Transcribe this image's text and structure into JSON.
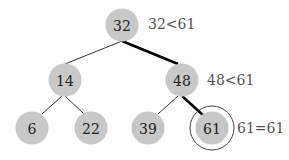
{
  "diagram": {
    "nodes": [
      {
        "id": "n32",
        "label": "32",
        "x": 122,
        "y": 25
      },
      {
        "id": "n14",
        "label": "14",
        "x": 65,
        "y": 80
      },
      {
        "id": "n48",
        "label": "48",
        "x": 182,
        "y": 80
      },
      {
        "id": "n6",
        "label": "6",
        "x": 32,
        "y": 128
      },
      {
        "id": "n22",
        "label": "22",
        "x": 91,
        "y": 128
      },
      {
        "id": "n39",
        "label": "39",
        "x": 148,
        "y": 128
      },
      {
        "id": "n61",
        "label": "61",
        "x": 212,
        "y": 128
      }
    ],
    "edges": [
      {
        "from": "n32",
        "to": "n14",
        "highlighted": false
      },
      {
        "from": "n32",
        "to": "n48",
        "highlighted": true
      },
      {
        "from": "n14",
        "to": "n6",
        "highlighted": false
      },
      {
        "from": "n14",
        "to": "n22",
        "highlighted": false
      },
      {
        "from": "n48",
        "to": "n39",
        "highlighted": false
      },
      {
        "from": "n48",
        "to": "n61",
        "highlighted": true
      }
    ],
    "annotations": [
      {
        "text": "32<61",
        "x": 148,
        "y": 24
      },
      {
        "text": "48<61",
        "x": 207,
        "y": 80
      },
      {
        "text": "61=61",
        "x": 237,
        "y": 128
      }
    ],
    "found_node": "61"
  }
}
